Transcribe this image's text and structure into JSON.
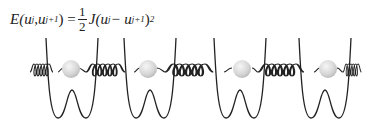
{
  "equation": {
    "lhs": "E(u",
    "lhs_sub1": "j",
    "lhs_mid": ",u",
    "lhs_sub2": "j+1",
    "lhs_close": ") =",
    "frac_num": "1",
    "frac_den": "2",
    "rhs_a": "J(u",
    "rhs_sub1": "j",
    "rhs_mid": " − u",
    "rhs_sub2": "j+1",
    "rhs_close": ")",
    "rhs_sup": "2"
  },
  "diagram": {
    "mass_count": 4,
    "mass_x": [
      70,
      148,
      242,
      328
    ],
    "colors": {
      "line": "#222222",
      "mass_fill": "#d8d8d8",
      "mass_highlight": "#f4f4f4"
    }
  }
}
